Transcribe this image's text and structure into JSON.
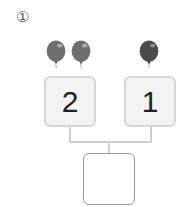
{
  "problem": {
    "number_label": "①",
    "left": {
      "value": "2",
      "balloon_count": 2,
      "balloon_color": "#6e6e6e"
    },
    "right": {
      "value": "1",
      "balloon_count": 1,
      "balloon_color": "#4a4a4a"
    },
    "answer": {
      "value": ""
    }
  },
  "colors": {
    "box_fill": "#f3f3f3",
    "box_border": "#d6d6d6",
    "answer_border": "#9a9a9a",
    "connector": "#cfcfcf"
  }
}
